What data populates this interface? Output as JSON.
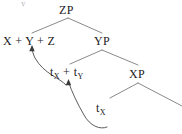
{
  "figure": {
    "kind": "syntactic-tree-diagram",
    "width": 182,
    "height": 134,
    "background_color": "#ffffff",
    "line_color": "#6b6b6b",
    "text_color": "#1a1a1a",
    "clipped_mark_top": "y"
  },
  "nodes": {
    "zp": {
      "label": "ZP",
      "x": 68,
      "y": 11
    },
    "xyz": {
      "label": "X + Y + Z",
      "x": 32,
      "y": 41
    },
    "yp": {
      "label": "YP",
      "x": 102,
      "y": 41
    },
    "txty": {
      "label": "t",
      "sub1": "X",
      "plus": " + t",
      "sub2": "Y",
      "x": 70,
      "y": 72
    },
    "xp": {
      "label": "XP",
      "x": 138,
      "y": 74
    },
    "tx": {
      "label": "t",
      "sub": "X",
      "x": 102,
      "y": 108
    }
  },
  "branches": [
    {
      "name": "zp-to-xyz",
      "from": [
        68,
        18
      ],
      "to": [
        32,
        33
      ]
    },
    {
      "name": "zp-to-yp",
      "from": [
        68,
        18
      ],
      "to": [
        102,
        33
      ]
    },
    {
      "name": "yp-to-txty",
      "from": [
        102,
        50
      ],
      "to": [
        70,
        64
      ]
    },
    {
      "name": "yp-to-xp",
      "from": [
        102,
        50
      ],
      "to": [
        138,
        65
      ]
    },
    {
      "name": "xp-to-left",
      "from": [
        138,
        83
      ],
      "to": [
        110,
        98
      ]
    },
    {
      "name": "xp-to-right",
      "from": [
        138,
        83
      ],
      "to": [
        182,
        106
      ]
    }
  ],
  "movement_arrows": [
    {
      "name": "y-movement-arrow",
      "description": "curve from t subscript X plus t subscript Y up to Y in X + Y + Z",
      "tail": [
        66,
        84
      ],
      "head": [
        32,
        47
      ]
    },
    {
      "name": "x-movement-arrow",
      "description": "curve from bottom t subscript X up to t subscript X in t X + t Y",
      "tail": [
        107,
        126
      ],
      "head": [
        68,
        81
      ]
    }
  ]
}
